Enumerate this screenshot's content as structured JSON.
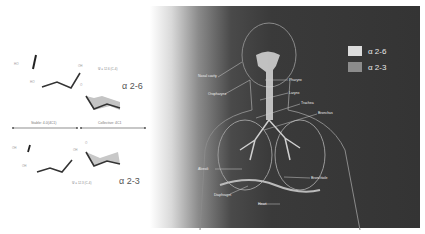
{
  "left_panel": {
    "top_structure": {
      "linkage_label": "α 2-6",
      "torsion_label": "Ψ = 12.6 (C-4)"
    },
    "divider": {
      "left_label": "Stable: 4.0(4C1)",
      "right_label": "Collective: 4C1"
    },
    "bottom_structure": {
      "linkage_label": "α 2-3",
      "torsion_label": "Ψ = 12.3 (C-4)"
    },
    "small_atom_labels": [
      "HO",
      "OH",
      "O",
      "HO",
      "OH",
      "O",
      "OH",
      "OH"
    ]
  },
  "right_panel": {
    "legend": [
      {
        "label": "α 2-6",
        "color": "#dcdcdc"
      },
      {
        "label": "α 2-3",
        "color": "#8c8c8c"
      }
    ],
    "anatomy_labels": [
      {
        "text": "Nasal cavity",
        "x": 198,
        "y": 75
      },
      {
        "text": "Oropharynx",
        "x": 208,
        "y": 93
      },
      {
        "text": "Pharynx",
        "x": 288,
        "y": 78
      },
      {
        "text": "Larynx",
        "x": 288,
        "y": 92
      },
      {
        "text": "Trachea",
        "x": 300,
        "y": 102
      },
      {
        "text": "Bronchus",
        "x": 317,
        "y": 113
      },
      {
        "text": "Alveoli",
        "x": 198,
        "y": 168
      },
      {
        "text": "Bronchiole",
        "x": 310,
        "y": 177
      },
      {
        "text": "Diaphragm",
        "x": 215,
        "y": 194
      },
      {
        "text": "Heart",
        "x": 260,
        "y": 203
      }
    ]
  },
  "colors": {
    "panel_dark": "#343434",
    "structure_line": "#333333",
    "shade_fill": "#bdbdbd"
  }
}
